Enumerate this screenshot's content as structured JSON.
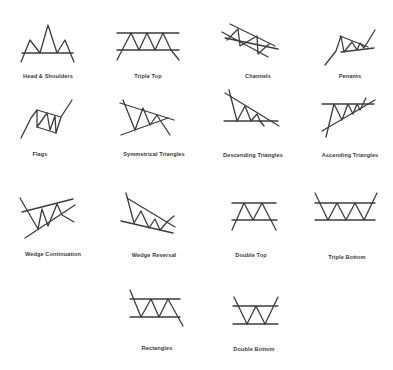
{
  "colors": {
    "line": "#3c3c3c",
    "label": "#3a3a3a",
    "background": "#ffffff"
  },
  "patterns": [
    {
      "id": "head-shoulders",
      "label": "Head & Shoulders",
      "label_x": 48,
      "label_y": 77,
      "lines": [
        [
          22,
          53,
          73,
          53
        ]
      ],
      "polylines": [
        [
          [
            21,
            62
          ],
          [
            30,
            40
          ],
          [
            40,
            53
          ],
          [
            48,
            25
          ],
          [
            57,
            53
          ],
          [
            65,
            40
          ],
          [
            74,
            62
          ]
        ]
      ]
    },
    {
      "id": "triple-top",
      "label": "Triple Top",
      "label_x": 148,
      "label_y": 77,
      "lines": [
        [
          117,
          33,
          179,
          33
        ],
        [
          117,
          50,
          179,
          50
        ]
      ],
      "polylines": [
        [
          [
            117,
            60
          ],
          [
            131,
            33
          ],
          [
            139,
            50
          ],
          [
            147,
            33
          ],
          [
            155,
            50
          ],
          [
            163,
            33
          ],
          [
            171,
            50
          ],
          [
            179,
            60
          ]
        ]
      ]
    },
    {
      "id": "channels",
      "label": "Channels",
      "label_x": 258,
      "label_y": 77,
      "lines": [
        [
          230,
          24,
          275,
          46
        ],
        [
          222,
          32,
          268,
          57
        ],
        [
          225,
          38,
          278,
          49
        ]
      ],
      "polylines": [
        [
          [
            227,
            40
          ],
          [
            238,
            29
          ],
          [
            240,
            46
          ],
          [
            257,
            36
          ],
          [
            258,
            54
          ],
          [
            269,
            44
          ]
        ]
      ]
    },
    {
      "id": "penants",
      "label": "Penants",
      "label_x": 350,
      "label_y": 77,
      "lines": [
        [
          341,
          52,
          374,
          48
        ],
        [
          340,
          36,
          368,
          47
        ]
      ],
      "polylines": [
        [
          [
            325,
            65
          ],
          [
            336,
            51
          ],
          [
            341,
            36
          ],
          [
            344,
            52
          ],
          [
            352,
            42
          ],
          [
            357,
            50
          ],
          [
            360,
            43
          ],
          [
            364,
            48
          ],
          [
            375,
            30
          ]
        ]
      ]
    },
    {
      "id": "flags",
      "label": "Flags",
      "label_x": 40,
      "label_y": 155,
      "lines": [
        [
          37,
          110,
          61,
          117
        ],
        [
          37,
          127,
          56,
          133
        ]
      ],
      "polylines": [
        [
          [
            21,
            138
          ],
          [
            31,
            118
          ],
          [
            37,
            110
          ],
          [
            37,
            127
          ],
          [
            47,
            113
          ],
          [
            50,
            130
          ],
          [
            55,
            116
          ],
          [
            56,
            133
          ],
          [
            61,
            117
          ],
          [
            72,
            100
          ]
        ]
      ]
    },
    {
      "id": "symmetrical-triangles",
      "label": "Symmetrical Triangles",
      "label_x": 154,
      "label_y": 155,
      "lines": [
        [
          120,
          103,
          174,
          120
        ],
        [
          121,
          135,
          168,
          118
        ]
      ],
      "polylines": [
        [
          [
            123,
            100
          ],
          [
            135,
            130
          ],
          [
            143,
            108
          ],
          [
            150,
            125
          ],
          [
            157,
            115
          ],
          [
            160,
            120
          ],
          [
            170,
            135
          ]
        ]
      ]
    },
    {
      "id": "descending-triangles",
      "label": "Descending Triangles",
      "label_x": 253,
      "label_y": 156,
      "lines": [
        [
          224,
          121,
          278,
          121
        ],
        [
          225,
          93,
          279,
          126
        ]
      ],
      "polylines": [
        [
          [
            229,
            90
          ],
          [
            237,
            121
          ],
          [
            245,
            106
          ],
          [
            251,
            121
          ],
          [
            257,
            114
          ],
          [
            260,
            121
          ],
          [
            264,
            126
          ]
        ]
      ]
    },
    {
      "id": "ascending-triangles",
      "label": "Ascending Triangles",
      "label_x": 350,
      "label_y": 156,
      "lines": [
        [
          322,
          104,
          374,
          104
        ],
        [
          322,
          131,
          375,
          100
        ]
      ],
      "polylines": [
        [
          [
            326,
            137
          ],
          [
            334,
            104
          ],
          [
            342,
            120
          ],
          [
            348,
            104
          ],
          [
            353,
            114
          ],
          [
            357,
            104
          ],
          [
            360,
            110
          ],
          [
            366,
            98
          ]
        ]
      ]
    },
    {
      "id": "wedge-continuation",
      "label": "Wedge Continuation",
      "label_x": 53,
      "label_y": 255,
      "lines": [
        [
          22,
          212,
          73,
          199
        ],
        [
          25,
          238,
          75,
          205
        ]
      ],
      "polylines": [
        [
          [
            20,
            198
          ],
          [
            38,
            229
          ],
          [
            42,
            209
          ],
          [
            48,
            226
          ],
          [
            57,
            204
          ],
          [
            62,
            215
          ],
          [
            74,
            222
          ]
        ]
      ]
    },
    {
      "id": "wedge-reversal",
      "label": "Wedge Reversal",
      "label_x": 154,
      "label_y": 256,
      "lines": [
        [
          127,
          198,
          175,
          227
        ],
        [
          121,
          221,
          173,
          233
        ]
      ],
      "polylines": [
        [
          [
            126,
            193
          ],
          [
            134,
            223
          ],
          [
            141,
            211
          ],
          [
            149,
            228
          ],
          [
            155,
            219
          ],
          [
            160,
            230
          ],
          [
            168,
            221
          ],
          [
            174,
            216
          ]
        ]
      ]
    },
    {
      "id": "double-top",
      "label": "Double Top",
      "label_x": 251,
      "label_y": 256,
      "lines": [
        [
          232,
          203,
          276,
          203
        ],
        [
          232,
          220,
          277,
          220
        ]
      ],
      "polylines": [
        [
          [
            232,
            230
          ],
          [
            244,
            203
          ],
          [
            253,
            220
          ],
          [
            262,
            203
          ],
          [
            276,
            230
          ]
        ]
      ]
    },
    {
      "id": "triple-bottom",
      "label": "Triple Bottom",
      "label_x": 347,
      "label_y": 258,
      "lines": [
        [
          315,
          203,
          375,
          203
        ],
        [
          315,
          220,
          375,
          220
        ]
      ],
      "polylines": [
        [
          [
            315,
            193
          ],
          [
            328,
            220
          ],
          [
            337,
            203
          ],
          [
            346,
            220
          ],
          [
            355,
            203
          ],
          [
            364,
            220
          ],
          [
            377,
            193
          ]
        ]
      ]
    },
    {
      "id": "rectangles",
      "label": "Rectangles",
      "label_x": 157,
      "label_y": 349,
      "lines": [
        [
          130,
          299,
          180,
          299
        ],
        [
          130,
          317,
          180,
          317
        ]
      ],
      "polylines": [
        [
          [
            130,
            290
          ],
          [
            141,
            317
          ],
          [
            151,
            299
          ],
          [
            159,
            317
          ],
          [
            168,
            299
          ],
          [
            183,
            326
          ]
        ]
      ]
    },
    {
      "id": "double-bottom",
      "label": "Double Bottom",
      "label_x": 254,
      "label_y": 350,
      "lines": [
        [
          233,
          306,
          278,
          306
        ],
        [
          233,
          324,
          278,
          324
        ]
      ],
      "polylines": [
        [
          [
            234,
            297
          ],
          [
            247,
            324
          ],
          [
            256,
            306
          ],
          [
            265,
            324
          ],
          [
            278,
            297
          ]
        ]
      ]
    }
  ]
}
